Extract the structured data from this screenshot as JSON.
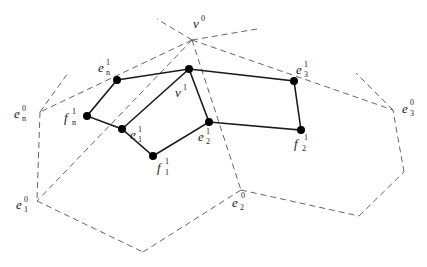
{
  "diagram": {
    "type": "geometric subdivision diagram",
    "colors": {
      "solid_edges": "#1a1a1a",
      "dashed_edges": "#555555",
      "nodes": "#000000",
      "background": "#ffffff"
    },
    "labels": {
      "v0": {
        "base": "v",
        "sup": "0",
        "sub": ""
      },
      "v1": {
        "base": "v",
        "sup": "1",
        "sub": ""
      },
      "en1": {
        "base": "e",
        "sup": "1",
        "sub": "n"
      },
      "en0": {
        "base": "e",
        "sup": "0",
        "sub": "n"
      },
      "fn1": {
        "base": "f",
        "sup": "1",
        "sub": "n"
      },
      "e11": {
        "base": "e",
        "sup": "1",
        "sub": "1"
      },
      "f11": {
        "base": "f",
        "sup": "1",
        "sub": "1"
      },
      "e21": {
        "base": "e",
        "sup": "1",
        "sub": "2"
      },
      "e31": {
        "base": "e",
        "sup": "1",
        "sub": "3"
      },
      "f21": {
        "base": "f",
        "sup": "1",
        "sub": "2"
      },
      "e30": {
        "base": "e",
        "sup": "0",
        "sub": "3"
      },
      "e10": {
        "base": "e",
        "sup": "0",
        "sub": "1"
      },
      "e20": {
        "base": "e",
        "sup": "0",
        "sub": "2"
      }
    },
    "nodes": [
      {
        "id": "v1",
        "x": 189,
        "y": 69
      },
      {
        "id": "en1",
        "x": 117,
        "y": 80
      },
      {
        "id": "fn1",
        "x": 87,
        "y": 116
      },
      {
        "id": "e11",
        "x": 122,
        "y": 129
      },
      {
        "id": "f11",
        "x": 153,
        "y": 156
      },
      {
        "id": "e21",
        "x": 209,
        "y": 122
      },
      {
        "id": "e31",
        "x": 294,
        "y": 81
      },
      {
        "id": "f21",
        "x": 301,
        "y": 130
      }
    ],
    "solid_edges": [
      [
        "en1",
        "v1"
      ],
      [
        "v1",
        "e31"
      ],
      [
        "e31",
        "f21"
      ],
      [
        "f21",
        "e21"
      ],
      [
        "e21",
        "v1"
      ],
      [
        "e21",
        "f11"
      ],
      [
        "f11",
        "e11"
      ],
      [
        "e11",
        "v1"
      ],
      [
        "e11",
        "fn1"
      ],
      [
        "fn1",
        "en1"
      ]
    ],
    "dashed_vertices": {
      "v0": [
        192,
        40
      ],
      "en0": [
        40,
        112
      ],
      "e10": [
        37,
        201
      ],
      "bottom": [
        143,
        252
      ],
      "e20": [
        241,
        190
      ],
      "br": [
        359,
        216
      ],
      "r": [
        404,
        172
      ],
      "e30": [
        393,
        110
      ]
    }
  }
}
